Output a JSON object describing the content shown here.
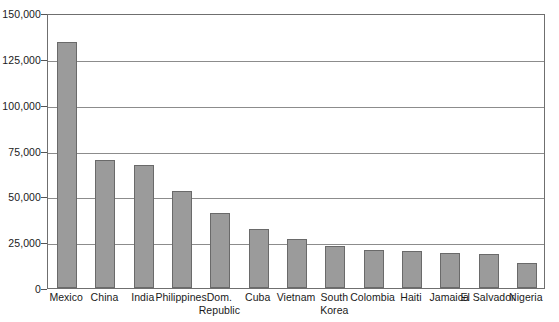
{
  "chart_data": {
    "type": "bar",
    "title": "",
    "xlabel": "",
    "ylabel": "",
    "ylim": [
      0,
      150000
    ],
    "grid": true,
    "legend": "none",
    "ytick_labels": [
      "0",
      "25,000",
      "50,000",
      "75,000",
      "100,000",
      "125,000",
      "150,000"
    ],
    "ytick_values": [
      0,
      25000,
      50000,
      75000,
      100000,
      125000,
      150000
    ],
    "categories": [
      "Mexico",
      "China",
      "India",
      "Philippines",
      "Dom.\nRepublic",
      "Cuba",
      "Vietnam",
      "South\nKorea",
      "Colombia",
      "Haiti",
      "Jamaica",
      "El Salvador",
      "Nigeria"
    ],
    "values": [
      134000,
      70000,
      67000,
      53000,
      41000,
      32000,
      27000,
      23000,
      21000,
      20000,
      19000,
      18500,
      13500
    ],
    "colors": {
      "bar_fill": "#9b9b9b",
      "bar_border": "#6a6a6a",
      "gridline": "#8c8c8c",
      "frame": "#6f6f6f",
      "text": "#1a1a1a",
      "background": "#ffffff"
    }
  }
}
